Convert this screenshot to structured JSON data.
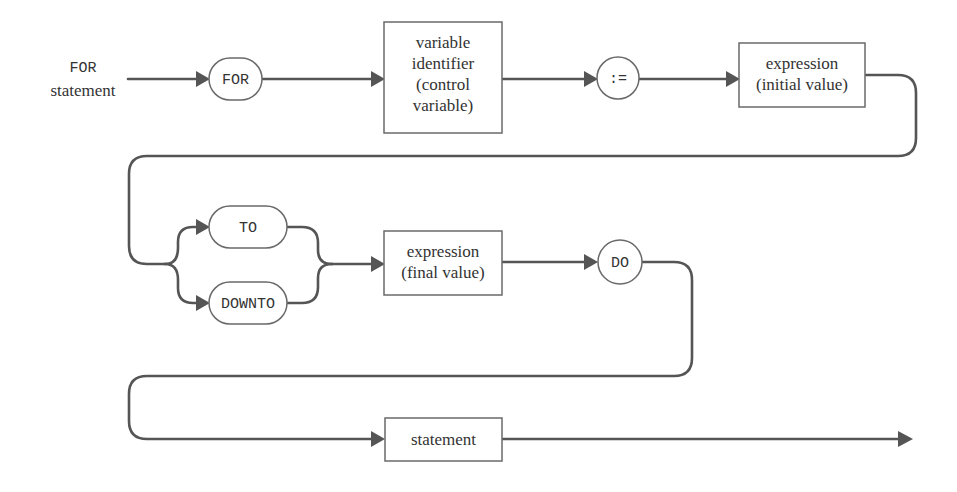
{
  "diagram": {
    "title_line1": "FOR",
    "title_line2": "statement",
    "nodes": {
      "for_kw": "FOR",
      "control_var": [
        "variable",
        "identifier",
        "(control",
        "variable)"
      ],
      "assign": ":=",
      "initial_expr": [
        "expression",
        "(initial value)"
      ],
      "to_kw": "TO",
      "downto_kw": "DOWNTO",
      "final_expr": [
        "expression",
        "(final value)"
      ],
      "do_kw": "DO",
      "statement": "statement"
    },
    "colors": {
      "line": "#555555",
      "box_border": "#6a6a6a",
      "text": "#333333",
      "background": "#ffffff"
    }
  }
}
